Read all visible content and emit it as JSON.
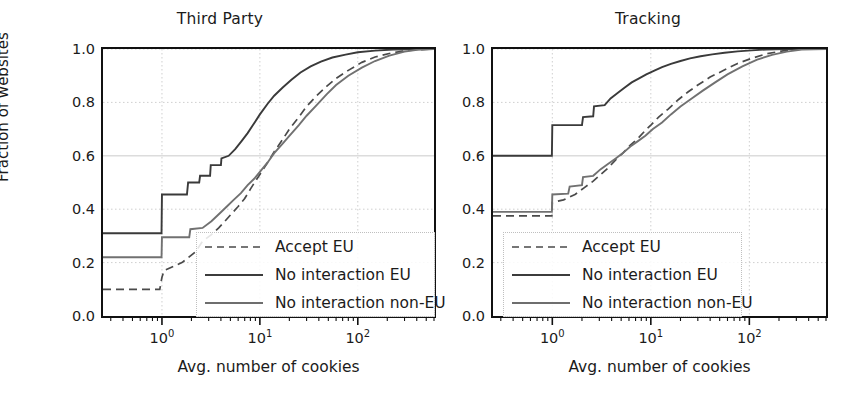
{
  "figure": {
    "xlabel": "Avg. number of cookies",
    "ylabel": "Fraction of websites",
    "ytick_labels": [
      "0.0",
      "0.2",
      "0.4",
      "0.6",
      "0.8",
      "1.0"
    ],
    "xtick_labels": [
      "10",
      "10",
      "10"
    ],
    "xtick_exponents": [
      "0",
      "1",
      "2"
    ],
    "legend": [
      {
        "label": "Accept EU",
        "style": "dashed",
        "color": "#4a4a4a"
      },
      {
        "label": "No interaction EU",
        "style": "solid",
        "color": "#3c3c3c"
      },
      {
        "label": "No interaction non-EU",
        "style": "solid",
        "color": "#6e6e6e"
      }
    ]
  },
  "panels": {
    "left": {
      "title": "Third Party"
    },
    "right": {
      "title": "Tracking"
    }
  },
  "chart_data": [
    {
      "type": "line",
      "title": "Third Party",
      "xlabel": "Avg. number of cookies",
      "ylabel": "Fraction of websites",
      "xscale": "log",
      "xlim": [
        0.25,
        600
      ],
      "ylim": [
        0.0,
        1.0
      ],
      "grid": true,
      "legend_position": "lower right",
      "series": [
        {
          "name": "Accept EU",
          "style": "dashed",
          "points": [
            [
              0.25,
              0.1
            ],
            [
              0.95,
              0.1
            ],
            [
              1.0,
              0.145
            ],
            [
              1.05,
              0.17
            ],
            [
              1.6,
              0.2
            ],
            [
              2.2,
              0.24
            ],
            [
              2.6,
              0.28
            ],
            [
              3.2,
              0.305
            ],
            [
              3.8,
              0.33
            ],
            [
              4.4,
              0.355
            ],
            [
              5.2,
              0.385
            ],
            [
              6.0,
              0.41
            ],
            [
              7.0,
              0.44
            ],
            [
              8.0,
              0.475
            ],
            [
              9.0,
              0.505
            ],
            [
              10.0,
              0.53
            ],
            [
              12.0,
              0.575
            ],
            [
              14.0,
              0.615
            ],
            [
              17.0,
              0.66
            ],
            [
              20.0,
              0.7
            ],
            [
              25.0,
              0.745
            ],
            [
              30.0,
              0.785
            ],
            [
              38.0,
              0.825
            ],
            [
              48.0,
              0.86
            ],
            [
              60.0,
              0.89
            ],
            [
              80.0,
              0.92
            ],
            [
              110.0,
              0.95
            ],
            [
              150.0,
              0.97
            ],
            [
              220.0,
              0.985
            ],
            [
              330.0,
              0.995
            ],
            [
              600.0,
              1.0
            ]
          ]
        },
        {
          "name": "No interaction EU",
          "style": "solid",
          "points": [
            [
              0.25,
              0.31
            ],
            [
              0.99,
              0.31
            ],
            [
              1.0,
              0.455
            ],
            [
              1.8,
              0.455
            ],
            [
              1.85,
              0.5
            ],
            [
              2.4,
              0.5
            ],
            [
              2.45,
              0.525
            ],
            [
              3.1,
              0.525
            ],
            [
              3.15,
              0.565
            ],
            [
              4.0,
              0.565
            ],
            [
              4.05,
              0.59
            ],
            [
              4.8,
              0.6
            ],
            [
              5.6,
              0.625
            ],
            [
              6.5,
              0.655
            ],
            [
              7.5,
              0.685
            ],
            [
              8.5,
              0.715
            ],
            [
              10.0,
              0.755
            ],
            [
              12.0,
              0.795
            ],
            [
              14.0,
              0.825
            ],
            [
              17.0,
              0.855
            ],
            [
              21.0,
              0.885
            ],
            [
              26.0,
              0.912
            ],
            [
              33.0,
              0.935
            ],
            [
              42.0,
              0.953
            ],
            [
              55.0,
              0.968
            ],
            [
              75.0,
              0.979
            ],
            [
              100.0,
              0.988
            ],
            [
              150.0,
              0.994
            ],
            [
              230.0,
              0.998
            ],
            [
              600.0,
              1.0
            ]
          ]
        },
        {
          "name": "No interaction non-EU",
          "style": "solid",
          "points": [
            [
              0.25,
              0.22
            ],
            [
              0.99,
              0.22
            ],
            [
              1.0,
              0.295
            ],
            [
              1.9,
              0.295
            ],
            [
              1.95,
              0.325
            ],
            [
              2.6,
              0.33
            ],
            [
              3.2,
              0.355
            ],
            [
              3.9,
              0.385
            ],
            [
              4.6,
              0.41
            ],
            [
              5.4,
              0.435
            ],
            [
              6.4,
              0.46
            ],
            [
              7.5,
              0.49
            ],
            [
              8.8,
              0.515
            ],
            [
              10.0,
              0.54
            ],
            [
              12.0,
              0.575
            ],
            [
              14.0,
              0.61
            ],
            [
              17.0,
              0.645
            ],
            [
              20.0,
              0.675
            ],
            [
              25.0,
              0.715
            ],
            [
              30.0,
              0.75
            ],
            [
              38.0,
              0.79
            ],
            [
              48.0,
              0.83
            ],
            [
              60.0,
              0.865
            ],
            [
              80.0,
              0.9
            ],
            [
              110.0,
              0.93
            ],
            [
              150.0,
              0.955
            ],
            [
              210.0,
              0.975
            ],
            [
              300.0,
              0.99
            ],
            [
              420.0,
              0.998
            ],
            [
              600.0,
              1.0
            ]
          ]
        }
      ]
    },
    {
      "type": "line",
      "title": "Tracking",
      "xlabel": "Avg. number of cookies",
      "ylabel": "Fraction of websites",
      "xscale": "log",
      "xlim": [
        0.25,
        600
      ],
      "ylim": [
        0.0,
        1.0
      ],
      "grid": true,
      "legend_position": "lower left",
      "series": [
        {
          "name": "Accept EU",
          "style": "dashed",
          "points": [
            [
              0.25,
              0.375
            ],
            [
              0.99,
              0.375
            ],
            [
              1.0,
              0.425
            ],
            [
              1.3,
              0.435
            ],
            [
              1.7,
              0.455
            ],
            [
              2.1,
              0.48
            ],
            [
              2.6,
              0.505
            ],
            [
              3.1,
              0.53
            ],
            [
              3.7,
              0.555
            ],
            [
              4.4,
              0.585
            ],
            [
              5.2,
              0.61
            ],
            [
              6.2,
              0.64
            ],
            [
              7.4,
              0.665
            ],
            [
              8.8,
              0.695
            ],
            [
              10.0,
              0.715
            ],
            [
              12.0,
              0.745
            ],
            [
              15.0,
              0.775
            ],
            [
              19.0,
              0.81
            ],
            [
              24.0,
              0.84
            ],
            [
              30.0,
              0.865
            ],
            [
              40.0,
              0.895
            ],
            [
              55.0,
              0.92
            ],
            [
              75.0,
              0.945
            ],
            [
              105.0,
              0.965
            ],
            [
              150.0,
              0.982
            ],
            [
              220.0,
              0.993
            ],
            [
              330.0,
              0.999
            ],
            [
              600.0,
              1.0
            ]
          ]
        },
        {
          "name": "No interaction EU",
          "style": "solid",
          "points": [
            [
              0.25,
              0.6
            ],
            [
              0.99,
              0.6
            ],
            [
              1.0,
              0.715
            ],
            [
              2.0,
              0.715
            ],
            [
              2.05,
              0.745
            ],
            [
              2.6,
              0.748
            ],
            [
              2.65,
              0.785
            ],
            [
              3.4,
              0.79
            ],
            [
              3.9,
              0.815
            ],
            [
              4.6,
              0.835
            ],
            [
              5.4,
              0.855
            ],
            [
              6.4,
              0.875
            ],
            [
              7.6,
              0.89
            ],
            [
              9.0,
              0.905
            ],
            [
              11.0,
              0.92
            ],
            [
              13.0,
              0.932
            ],
            [
              16.0,
              0.944
            ],
            [
              20.0,
              0.955
            ],
            [
              25.0,
              0.965
            ],
            [
              32.0,
              0.973
            ],
            [
              42.0,
              0.98
            ],
            [
              56.0,
              0.986
            ],
            [
              76.0,
              0.991
            ],
            [
              105.0,
              0.995
            ],
            [
              150.0,
              0.998
            ],
            [
              230.0,
              1.0
            ],
            [
              600.0,
              1.0
            ]
          ]
        },
        {
          "name": "No interaction non-EU",
          "style": "solid",
          "points": [
            [
              0.25,
              0.39
            ],
            [
              0.99,
              0.39
            ],
            [
              1.0,
              0.455
            ],
            [
              1.45,
              0.458
            ],
            [
              1.5,
              0.485
            ],
            [
              2.0,
              0.49
            ],
            [
              2.05,
              0.52
            ],
            [
              2.6,
              0.525
            ],
            [
              3.1,
              0.55
            ],
            [
              3.7,
              0.57
            ],
            [
              4.4,
              0.59
            ],
            [
              5.2,
              0.61
            ],
            [
              6.2,
              0.635
            ],
            [
              7.4,
              0.655
            ],
            [
              8.8,
              0.675
            ],
            [
              10.5,
              0.7
            ],
            [
              13.0,
              0.725
            ],
            [
              16.0,
              0.755
            ],
            [
              20.0,
              0.785
            ],
            [
              26.0,
              0.815
            ],
            [
              34.0,
              0.845
            ],
            [
              45.0,
              0.875
            ],
            [
              60.0,
              0.905
            ],
            [
              85.0,
              0.935
            ],
            [
              120.0,
              0.96
            ],
            [
              170.0,
              0.978
            ],
            [
              240.0,
              0.99
            ],
            [
              340.0,
              0.998
            ],
            [
              600.0,
              1.0
            ]
          ]
        }
      ]
    }
  ]
}
